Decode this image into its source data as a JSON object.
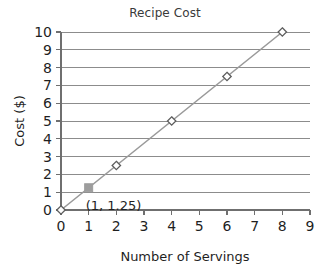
{
  "chart_data": {
    "type": "line",
    "title": "Recipe Cost",
    "xlabel": "Number of Servings",
    "ylabel": "Cost ($)",
    "xlim": [
      0,
      9
    ],
    "ylim": [
      0,
      10
    ],
    "grid": true,
    "grid_axis": "y",
    "legend": false,
    "x": [
      0,
      2,
      4,
      6,
      8
    ],
    "values": [
      0,
      2.5,
      5,
      7.5,
      10
    ],
    "series": [
      {
        "name": "Recipe Cost",
        "marker": "open-diamond",
        "points": [
          {
            "x": 0,
            "y": 0
          },
          {
            "x": 2,
            "y": 2.5
          },
          {
            "x": 4,
            "y": 5
          },
          {
            "x": 6,
            "y": 7.5
          },
          {
            "x": 8,
            "y": 10
          }
        ]
      }
    ],
    "slope": 1.25,
    "xticks": [
      0,
      1,
      2,
      3,
      4,
      5,
      6,
      7,
      8,
      9
    ],
    "xtick_labels": [
      "0",
      "1",
      "2",
      "3",
      "4",
      "5",
      "6",
      "7",
      "8",
      "9"
    ],
    "yticks": [
      0,
      1,
      2,
      3,
      4,
      5,
      6,
      7,
      8,
      9,
      10
    ],
    "ytick_labels": [
      "0",
      "1",
      "2",
      "3",
      "4",
      "5",
      "6",
      "7",
      "8",
      "9",
      "10"
    ],
    "annotations": [
      {
        "label": "(1, 1.25)",
        "x": 1,
        "y": 1.25,
        "marker": "filled-square",
        "marker_color": "#9d9d9d"
      }
    ],
    "colors": {
      "line": "#9a9a9a",
      "grid": "#8c8c8c",
      "axis": "#6f6f6f",
      "marker_stroke": "#5d5d5d",
      "marker_fill": "#ffffff",
      "highlight": "#9d9d9d",
      "text": "#1f1f1f",
      "title": "#3a3a3a",
      "background": "#ffffff"
    }
  }
}
